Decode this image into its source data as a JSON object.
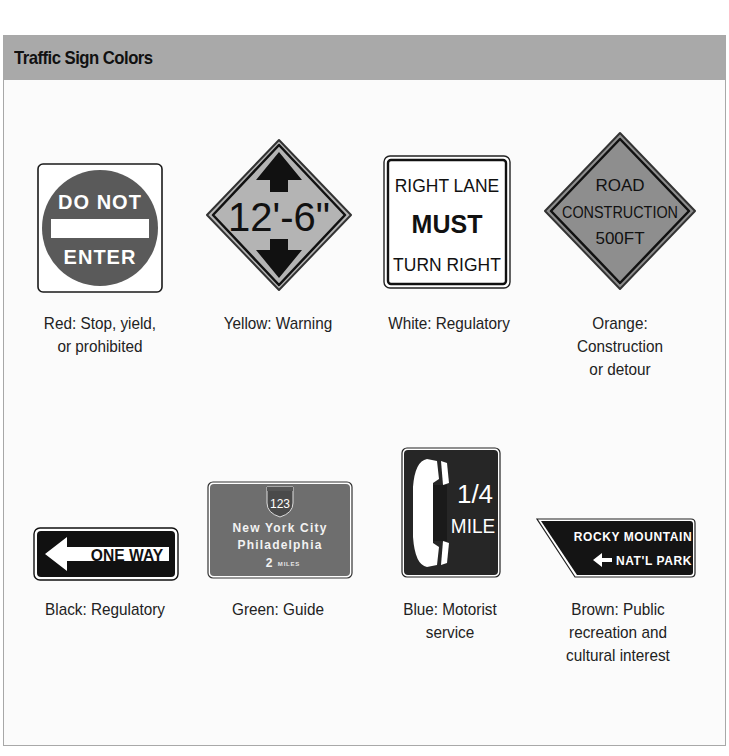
{
  "figure": {
    "title": "Traffic Sign Colors"
  },
  "signs": [
    {
      "id": "red",
      "shape": "square-with-circle",
      "color_hex": "#5a5a5a",
      "lines": [
        "DO NOT",
        "ENTER"
      ],
      "caption_lines": [
        "Red: Stop, yield,",
        "or prohibited"
      ]
    },
    {
      "id": "yellow",
      "shape": "diamond",
      "color_hex": "#b4b4b4",
      "lines": [
        "12'-6\""
      ],
      "icons": [
        "arrow-up-icon",
        "arrow-down-icon"
      ],
      "caption_lines": [
        "Yellow: Warning"
      ]
    },
    {
      "id": "white",
      "shape": "square",
      "color_hex": "#ffffff",
      "lines": [
        "RIGHT LANE",
        "MUST",
        "TURN RIGHT"
      ],
      "caption_lines": [
        "White: Regulatory"
      ]
    },
    {
      "id": "orange",
      "shape": "diamond",
      "color_hex": "#8e8e8e",
      "lines": [
        "ROAD",
        "CONSTRUCTION",
        "500FT"
      ],
      "caption_lines": [
        "Orange:",
        "Construction",
        "or detour"
      ]
    },
    {
      "id": "black",
      "shape": "rectangle",
      "color_hex": "#111111",
      "lines": [
        "ONE WAY"
      ],
      "icons": [
        "arrow-left-icon"
      ],
      "caption_lines": [
        "Black: Regulatory"
      ]
    },
    {
      "id": "green",
      "shape": "rectangle",
      "color_hex": "#6e6e6e",
      "shield": "123",
      "lines": [
        "New York City",
        "Philadelphia"
      ],
      "distance_number": "2",
      "distance_unit": "MILES",
      "caption_lines": [
        "Green: Guide"
      ]
    },
    {
      "id": "blue",
      "shape": "rectangle",
      "color_hex": "#262626",
      "icons": [
        "telephone-icon"
      ],
      "lines": [
        "1/4",
        "MILE"
      ],
      "caption_lines": [
        "Blue: Motorist",
        "service"
      ]
    },
    {
      "id": "brown",
      "shape": "trapezoid",
      "color_hex": "#141414",
      "lines": [
        "ROCKY MOUNTAIN",
        "NAT'L PARK"
      ],
      "icons": [
        "arrow-left-icon"
      ],
      "caption_lines": [
        "Brown: Public",
        "recreation and",
        "cultural interest"
      ]
    }
  ]
}
